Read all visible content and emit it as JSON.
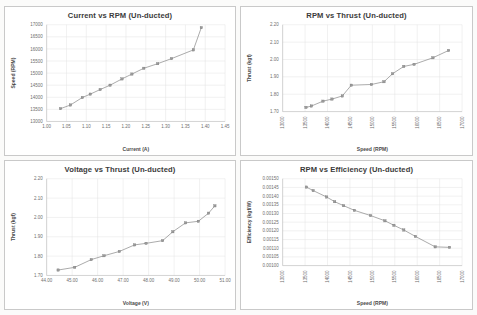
{
  "page": {
    "background_color": "#fbfbfa",
    "card_background": "#ffffff",
    "line_color": "#8d8d8d",
    "marker_color": "#9a9a9a",
    "grid_color": "#e3e3e3",
    "text_color": "#3b3b3b"
  },
  "chart_data": [
    {
      "id": "current-vs-rpm",
      "type": "line",
      "title": "Current vs RPM (Un-ducted)",
      "xlabel": "Current (A)",
      "ylabel": "Speed (RPM)",
      "xlim": [
        1.0,
        1.45
      ],
      "ylim": [
        13000,
        17000
      ],
      "xticks": [
        "1.00",
        "1.05",
        "1.10",
        "1.15",
        "1.20",
        "1.25",
        "1.30",
        "1.35",
        "1.40",
        "1.45"
      ],
      "xtickvals": [
        1.0,
        1.05,
        1.1,
        1.15,
        1.2,
        1.25,
        1.3,
        1.35,
        1.4,
        1.45
      ],
      "yticks": [
        "13000",
        "13500",
        "14000",
        "14500",
        "15000",
        "15500",
        "16000",
        "16500",
        "17000"
      ],
      "ytickvals": [
        13000,
        13500,
        14000,
        14500,
        15000,
        15500,
        16000,
        16500,
        17000
      ],
      "grid": true,
      "legend": "none",
      "x": [
        1.035,
        1.06,
        1.09,
        1.11,
        1.135,
        1.16,
        1.19,
        1.215,
        1.245,
        1.28,
        1.315,
        1.37,
        1.39
      ],
      "y": [
        13530,
        13680,
        13990,
        14130,
        14320,
        14500,
        14760,
        14960,
        15200,
        15390,
        15600,
        15960,
        16880
      ]
    },
    {
      "id": "rpm-vs-thrust",
      "type": "line",
      "title": "RPM vs Thrust (Un-ducted)",
      "xlabel": "Speed (RPM)",
      "ylabel": "Thrust (kgf)",
      "xlim": [
        13000,
        17000
      ],
      "ylim": [
        1.7,
        2.2
      ],
      "xticks": [
        "13000",
        "13500",
        "14000",
        "14500",
        "15000",
        "15500",
        "16000",
        "16500",
        "17000"
      ],
      "xtickvals": [
        13000,
        13500,
        14000,
        14500,
        15000,
        15500,
        16000,
        16500,
        17000
      ],
      "yticks": [
        "1.70",
        "1.80",
        "1.90",
        "2.00",
        "2.10",
        "2.20"
      ],
      "ytickvals": [
        1.7,
        1.8,
        1.9,
        2.0,
        2.1,
        2.2
      ],
      "grid": true,
      "legend": "none",
      "x": [
        13520,
        13640,
        13900,
        14100,
        14330,
        14530,
        14980,
        15260,
        15450,
        15700,
        15930,
        16350,
        16700
      ],
      "y": [
        1.724,
        1.732,
        1.76,
        1.772,
        1.79,
        1.852,
        1.856,
        1.872,
        1.918,
        1.96,
        1.972,
        2.01,
        2.052
      ]
    },
    {
      "id": "voltage-vs-thrust",
      "type": "line",
      "title": "Voltage vs Thrust (Un-ducted)",
      "xlabel": "Voltage (V)",
      "ylabel": "Thrust (kgf)",
      "xlim": [
        44.0,
        51.0
      ],
      "ylim": [
        1.7,
        2.2
      ],
      "xticks": [
        "44.00",
        "45.00",
        "46.00",
        "47.00",
        "48.00",
        "49.00",
        "50.00",
        "51.00"
      ],
      "xtickvals": [
        44.0,
        45.0,
        46.0,
        47.0,
        48.0,
        49.0,
        50.0,
        51.0
      ],
      "yticks": [
        "1.70",
        "1.80",
        "1.90",
        "2.00",
        "2.10",
        "2.20"
      ],
      "ytickvals": [
        1.7,
        1.8,
        1.9,
        2.0,
        2.1,
        2.2
      ],
      "grid": true,
      "legend": "none",
      "x": [
        44.45,
        45.1,
        45.75,
        46.25,
        46.85,
        47.45,
        47.9,
        48.55,
        48.95,
        49.45,
        49.95,
        50.35,
        50.6
      ],
      "y": [
        1.728,
        1.742,
        1.782,
        1.802,
        1.824,
        1.858,
        1.866,
        1.88,
        1.926,
        1.972,
        1.98,
        2.022,
        2.06
      ]
    },
    {
      "id": "rpm-vs-efficiency",
      "type": "line",
      "title": "RPM vs Efficiency (Un-ducted)",
      "xlabel": "Speed (RPM)",
      "ylabel": "Efficiency (kgf/W)",
      "xlim": [
        13000,
        17000
      ],
      "ylim": [
        0.001,
        0.0015
      ],
      "xticks": [
        "13000",
        "13500",
        "14000",
        "14500",
        "15000",
        "15500",
        "16000",
        "16500",
        "17000"
      ],
      "xtickvals": [
        13000,
        13500,
        14000,
        14500,
        15000,
        15500,
        16000,
        16500,
        17000
      ],
      "yticks": [
        "0.00100",
        "0.00105",
        "0.00110",
        "0.00115",
        "0.00120",
        "0.00125",
        "0.00130",
        "0.00135",
        "0.00140",
        "0.00145",
        "0.00150"
      ],
      "ytickvals": [
        0.001,
        0.00105,
        0.0011,
        0.00115,
        0.0012,
        0.00125,
        0.0013,
        0.00135,
        0.0014,
        0.00145,
        0.0015
      ],
      "grid": true,
      "legend": "none",
      "x": [
        13530,
        13680,
        13980,
        14160,
        14360,
        14600,
        14960,
        15280,
        15480,
        15700,
        15960,
        16400,
        16720
      ],
      "y": [
        0.001452,
        0.001432,
        0.001395,
        0.001368,
        0.001345,
        0.001318,
        0.001288,
        0.001258,
        0.001232,
        0.001205,
        0.001168,
        0.001108,
        0.001105
      ]
    }
  ]
}
